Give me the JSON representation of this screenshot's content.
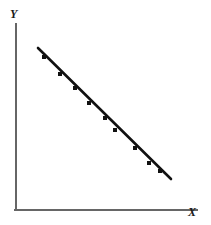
{
  "figure": {
    "background_color": "#ffffff",
    "width": 211,
    "height": 225
  },
  "axes": {
    "y_axis_label": "Y",
    "x_axis_label": "X",
    "axis_color": "#666666",
    "axis_line_width": 2,
    "origin_px": [
      16,
      210
    ],
    "y_axis_top_px": [
      16,
      24
    ],
    "x_axis_right_px": [
      197,
      210
    ],
    "ticks_shown": false,
    "gridlines_shown": false,
    "tick_labels": []
  },
  "chart_data": {
    "type": "line",
    "title": "",
    "subtitle": "",
    "xlabel": "X",
    "ylabel": "Y",
    "xlim": [
      0,
      10
    ],
    "ylim": [
      0,
      10
    ],
    "grid": false,
    "legend": null,
    "legend_position": "none",
    "annotations": [],
    "marker": "square",
    "marker_color": "#111111",
    "line_color": "#111111",
    "line_width": 2.6,
    "marker_size": 4,
    "x": [
      1.2,
      2.4,
      3.2,
      4.0,
      4.9,
      5.8,
      6.4,
      7.6,
      8.4
    ],
    "y": [
      8.5,
      7.5,
      6.7,
      5.8,
      5.0,
      4.2,
      3.5,
      2.4,
      1.6
    ],
    "series": [
      {
        "name": "data",
        "x": [
          1.2,
          2.4,
          3.2,
          4.0,
          4.9,
          5.8,
          6.4,
          7.6,
          8.4
        ],
        "values": [
          8.5,
          7.5,
          6.7,
          5.8,
          5.0,
          4.2,
          3.5,
          2.4,
          1.6
        ]
      }
    ],
    "line_endpoints_px": [
      [
        38,
        48
      ],
      [
        171,
        179
      ]
    ],
    "points_px": [
      [
        44,
        57
      ],
      [
        60,
        74
      ],
      [
        75,
        88
      ],
      [
        89,
        103
      ],
      [
        105,
        118
      ],
      [
        115,
        130
      ],
      [
        135,
        148
      ],
      [
        149,
        163
      ],
      [
        160,
        171
      ]
    ]
  }
}
